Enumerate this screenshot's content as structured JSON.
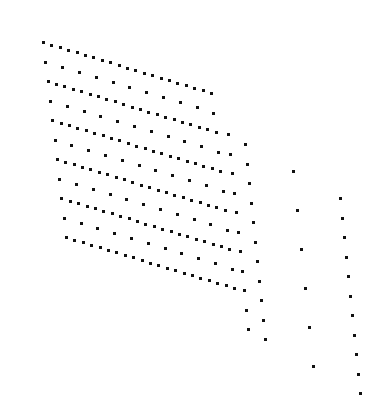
{
  "figure": {
    "type": "dot-lattice",
    "background": "#ffffff",
    "dot_color": "#111111",
    "dot_size": 3
  },
  "lattice": {
    "origin": [
      42,
      41
    ],
    "row_step": [
      2.3,
      19.5
    ],
    "col_step": [
      8.4,
      2.55
    ],
    "rows": 11,
    "dense_cols": 21,
    "sparse_col_stride": 2
  },
  "extra_columns": [
    {
      "name": "col-a",
      "x0": 227,
      "y0": 133,
      "dx": 2.0,
      "dy": 19.5,
      "count": 11
    },
    {
      "name": "col-b",
      "x0": 244,
      "y0": 143,
      "dx": 2.0,
      "dy": 19.5,
      "count": 11
    },
    {
      "name": "col-c",
      "x0": 292,
      "y0": 170,
      "dx": 4.0,
      "dy": 39.0,
      "count": 6
    },
    {
      "name": "col-d",
      "x0": 339,
      "y0": 197,
      "dx": 2.0,
      "dy": 19.5,
      "count": 11
    }
  ]
}
